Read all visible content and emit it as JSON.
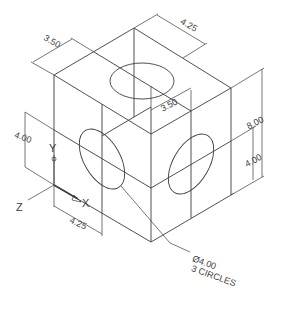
{
  "drawing": {
    "type": "isometric cube with circles",
    "stroke_color": "#3c3c3c",
    "background": "#ffffff",
    "dimensions": {
      "top_depth": "3.50",
      "top_width": "4.25",
      "inner_offset": "3.50",
      "height_total": "8.00",
      "height_right_half": "4.00",
      "height_left_half": "4.00",
      "bottom_width": "4.25"
    },
    "axes": {
      "x_label": "X",
      "y_label": "Y",
      "z_label": "Z"
    },
    "callout": {
      "line1": "Ø4.00",
      "line2": "3 CIRCLES"
    }
  }
}
